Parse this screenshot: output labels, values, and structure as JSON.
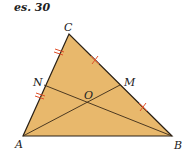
{
  "title": "es. 30",
  "colors": {
    "fill": "#E8B86C",
    "stroke": "#2a2015",
    "tick": "#E0502A"
  },
  "points": {
    "A": {
      "label": "A",
      "x": 23,
      "y": 136
    },
    "B": {
      "label": "B",
      "x": 172,
      "y": 136
    },
    "C": {
      "label": "C",
      "x": 69,
      "y": 34
    },
    "N": {
      "label": "N",
      "x": 44,
      "y": 85
    },
    "M": {
      "label": "M",
      "x": 120,
      "y": 85
    },
    "O": {
      "label": "O",
      "x": 88,
      "y": 102
    }
  },
  "segments": [
    "AB",
    "BC",
    "CA",
    "AM",
    "BN"
  ]
}
